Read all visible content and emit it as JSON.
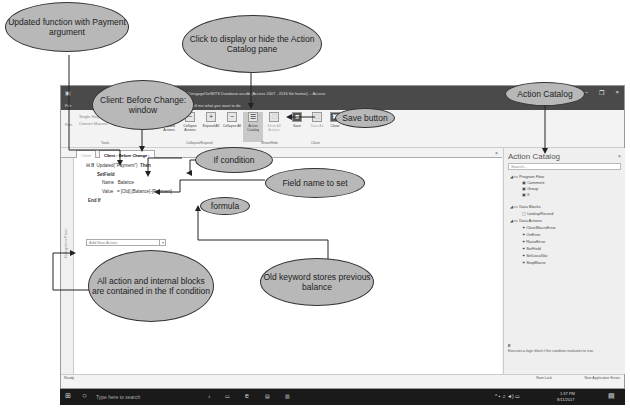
{
  "window": {
    "title": "BITS Database : Database- C:\\Cengage\\5e\\BITS Database.accdb (Access 2007 - 2016 file format) -- Access",
    "user": "Joy Starks",
    "controls": [
      "?",
      "–",
      "❐",
      "×"
    ]
  },
  "menubar": {
    "file": "File",
    "tell_me": "Tell me what you want to do"
  },
  "ribbon": {
    "tools": [
      "Single Step",
      "Convert Macros"
    ],
    "buttons": [
      {
        "label": "Expand Actions",
        "icon": "+"
      },
      {
        "label": "Collapse Actions",
        "icon": "−"
      },
      {
        "label": "Expand All",
        "icon": "+"
      },
      {
        "label": "Collapse All",
        "icon": "−"
      },
      {
        "label": "Action Catalog",
        "icon": "☰"
      },
      {
        "label": "Show All Actions",
        "icon": "□"
      },
      {
        "label": "Save",
        "icon": "💾"
      },
      {
        "label": "Save As",
        "icon": "□"
      },
      {
        "label": "Close",
        "icon": "✖"
      }
    ],
    "groups": [
      "Tools",
      "Collapse/Expand",
      "Show/Hide",
      "Close"
    ]
  },
  "tabs": [
    {
      "label": "Client"
    },
    {
      "label": "Client : Before Change :"
    }
  ],
  "macro": {
    "if_keyword": "If",
    "condition": "Updated(\"Payment\")",
    "then_keyword": "Then",
    "action": "SetField",
    "name_label": "Name",
    "name_value": "Balance",
    "value_label": "Value",
    "value_value": "= [Old].[Balance]-[Payment]",
    "end_if": "End If",
    "add_new_action": "Add New Action"
  },
  "nav_pane_label": "Navigation Pane",
  "action_catalog": {
    "title": "Action Catalog",
    "search_placeholder": "Search...",
    "sections": [
      {
        "label": "Program Flow",
        "items": [
          "Comment",
          "Group",
          "If"
        ]
      },
      {
        "label": "Data Blocks",
        "items": [
          "LookupRecord"
        ]
      },
      {
        "label": "Data Actions",
        "items": [
          "ClearMacroError",
          "OnError",
          "RaiseError",
          "SetField",
          "SetLocalVar",
          "StopMacro"
        ]
      }
    ],
    "desc_title": "If",
    "description": "Executes a logic block if the condition evaluates to true."
  },
  "statusbar": {
    "left": "Ready",
    "num_lock": "Num Lock",
    "app_errors": "New Application Errors"
  },
  "taskbar": {
    "search_placeholder": "Type here to search",
    "time": "1:37 PM",
    "date": "8/11/2017"
  },
  "callouts": {
    "updated_function": "Updated function with Payment argument",
    "action_catalog_toggle": "Click to display or hide the Action Catalog pane",
    "client_window": "Client: Before Change: window",
    "save_button": "Save button",
    "action_catalog": "Action Catalog",
    "if_condition": "If condition",
    "field_name": "Field name to set",
    "formula": "formula",
    "all_contained": "All action and internal blocks are contained in the If condition",
    "old_keyword": "Old keyword stores previous balance"
  }
}
